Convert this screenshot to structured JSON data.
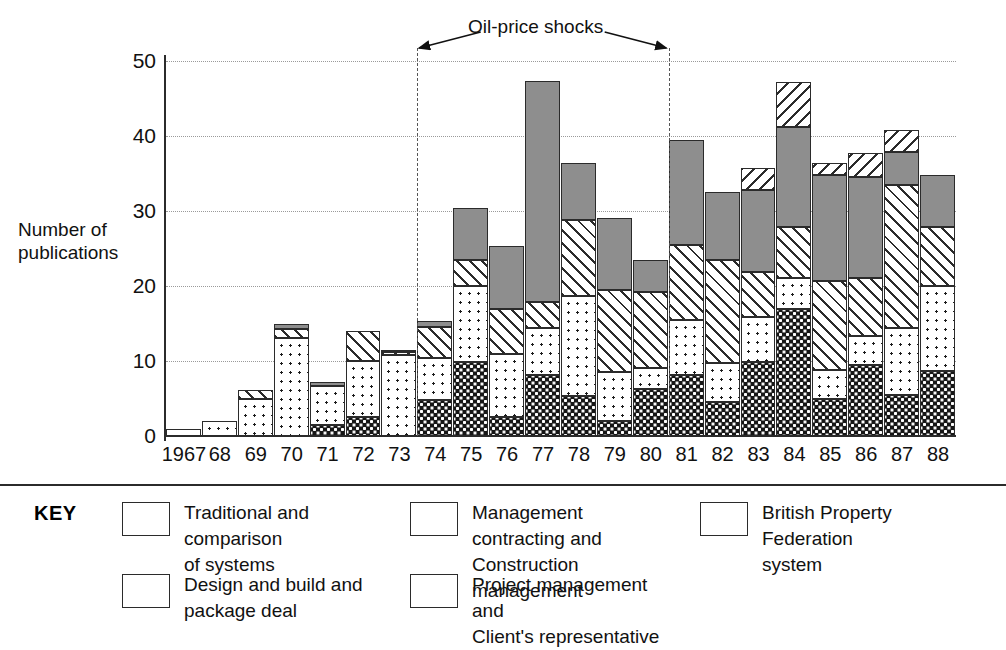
{
  "chart_data": {
    "type": "bar",
    "subtype": "stacked",
    "title": "",
    "xlabel": "",
    "ylabel": "Number of\npublications",
    "ylim": [
      0,
      50
    ],
    "yticks": [
      0,
      10,
      20,
      30,
      40,
      50
    ],
    "grid": true,
    "legend_position": "bottom",
    "categories": [
      "1967",
      "68",
      "69",
      "70",
      "71",
      "72",
      "73",
      "74",
      "75",
      "76",
      "77",
      "78",
      "79",
      "80",
      "81",
      "82",
      "83",
      "84",
      "85",
      "86",
      "87",
      "88"
    ],
    "series": [
      {
        "name": "Traditional and comparison of systems",
        "key": "traditional",
        "pattern": "dark-dotted",
        "color": "#161616",
        "values": [
          0,
          0,
          0,
          0,
          1.5,
          2.5,
          0,
          4.8,
          9.9,
          2.5,
          8.1,
          5.3,
          2.0,
          6.3,
          8.2,
          4.6,
          9.9,
          17.0,
          5.0,
          9.5,
          5.5,
          8.7
        ]
      },
      {
        "name": "Design and build and package deal",
        "key": "design",
        "pattern": "light-dotted",
        "color": "#ffffff",
        "values": [
          1.0,
          2.0,
          5.0,
          13.1,
          5.2,
          7.5,
          10.8,
          5.6,
          10.1,
          8.5,
          6.3,
          13.4,
          6.5,
          2.8,
          7.3,
          5.1,
          6.0,
          4.1,
          3.8,
          3.8,
          8.9,
          11.3
        ]
      },
      {
        "name": "Management contracting and Construction management",
        "key": "mgmt",
        "pattern": "forward-hatch",
        "color": "#ffffff",
        "values": [
          0,
          0,
          1.2,
          1.2,
          0,
          4.0,
          0.4,
          4.2,
          3.5,
          5.9,
          3.5,
          10.1,
          11.0,
          10.1,
          10.0,
          13.8,
          6.0,
          6.8,
          11.9,
          7.8,
          19.1,
          7.9
        ]
      },
      {
        "name": "Project management and Client's representative",
        "key": "project",
        "pattern": "solid-grey",
        "color": "#8e8e8e",
        "values": [
          0,
          0,
          0,
          0.7,
          0.5,
          0,
          0.3,
          0.8,
          6.9,
          8.4,
          29.4,
          7.6,
          9.6,
          4.3,
          14.0,
          9.0,
          10.9,
          13.3,
          14.1,
          13.4,
          4.4,
          6.9
        ]
      },
      {
        "name": "British Property Federation system",
        "key": "bpf",
        "pattern": "back-hatch",
        "color": "#ffffff",
        "values": [
          0,
          0,
          0,
          0,
          0,
          0,
          0,
          0,
          0,
          0,
          0,
          0,
          0,
          0,
          0,
          0,
          2.9,
          6.0,
          1.6,
          3.2,
          2.9,
          0
        ]
      }
    ],
    "totals": [
      1.0,
      2.0,
      6.2,
      15.0,
      7.2,
      14.0,
      11.5,
      15.4,
      30.4,
      25.3,
      47.3,
      36.4,
      29.1,
      23.5,
      39.5,
      32.5,
      35.7,
      47.2,
      36.4,
      37.7,
      40.8,
      34.8
    ],
    "annotation": {
      "label": "Oil-price shocks",
      "from_category": "73",
      "to_category": "80"
    }
  },
  "axis": {
    "y_title": "Number of\npublications",
    "y_ticks": [
      "0",
      "10",
      "20",
      "30",
      "40",
      "50"
    ],
    "x_ticks": [
      "1967",
      "68",
      "69",
      "70",
      "71",
      "72",
      "73",
      "74",
      "75",
      "76",
      "77",
      "78",
      "79",
      "80",
      "81",
      "82",
      "83",
      "84",
      "85",
      "86",
      "87",
      "88"
    ]
  },
  "annotation": {
    "label": "Oil-price shocks"
  },
  "legend": {
    "key_label": "KEY",
    "items": [
      {
        "label": "Traditional and comparison\nof systems",
        "pattern": "dark-dotted"
      },
      {
        "label": "Design and build and\npackage deal",
        "pattern": "light-dotted"
      },
      {
        "label": "Management contracting and\nConstruction management",
        "pattern": "forward-hatch"
      },
      {
        "label": "Project management and\nClient's representative",
        "pattern": "solid-grey"
      },
      {
        "label": "British Property Federation\nsystem",
        "pattern": "back-hatch"
      }
    ]
  }
}
